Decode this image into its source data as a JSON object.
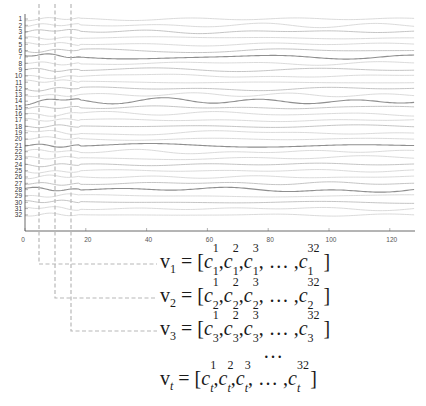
{
  "chart_data": {
    "type": "line",
    "title": "",
    "xlabel": "",
    "ylabel": "",
    "x_ticks": [
      0,
      20,
      40,
      60,
      80,
      100,
      120
    ],
    "xlim": [
      0,
      128
    ],
    "channels": [
      "1",
      "2",
      "3",
      "4",
      "5",
      "6",
      "7",
      "8",
      "9",
      "10",
      "11",
      "12",
      "13",
      "14",
      "15",
      "16",
      "17",
      "18",
      "19",
      "20",
      "21",
      "22",
      "23",
      "24",
      "25",
      "26",
      "27",
      "28",
      "29",
      "30",
      "31",
      "32"
    ],
    "emphasized_channels": [
      7,
      14,
      21,
      28
    ],
    "highlighted_time_steps": [
      5,
      10,
      15
    ],
    "series_description": "32 stacked multichannel EEG-like signal traces over 128 time samples"
  },
  "colors": {
    "trace_light": "#d6d6d6",
    "trace_mid": "#bdbdbd",
    "trace_dark": "#8f8f8f",
    "dashed": "#b8b8b8",
    "axis": "#444444",
    "text": "#1a1a1a"
  },
  "equations": [
    {
      "vector": "v",
      "sub": "1",
      "italic_sub": false,
      "elements": [
        {
          "sup": "1",
          "sub": "1"
        },
        {
          "sup": "2",
          "sub": "1"
        },
        {
          "sup": "3",
          "sub": "1"
        }
      ],
      "ellipsis": "…",
      "last": {
        "sup": "32",
        "sub": "1"
      }
    },
    {
      "vector": "v",
      "sub": "2",
      "italic_sub": false,
      "elements": [
        {
          "sup": "1",
          "sub": "2"
        },
        {
          "sup": "2",
          "sub": "2"
        },
        {
          "sup": "3",
          "sub": "2"
        }
      ],
      "ellipsis": "…",
      "last": {
        "sup": "32",
        "sub": "2"
      }
    },
    {
      "vector": "v",
      "sub": "3",
      "italic_sub": false,
      "elements": [
        {
          "sup": "1",
          "sub": "3"
        },
        {
          "sup": "2",
          "sub": "3"
        },
        {
          "sup": "3",
          "sub": "3"
        }
      ],
      "ellipsis": "…",
      "last": {
        "sup": "32",
        "sub": "3"
      }
    },
    {
      "vector": "v",
      "sub": "t",
      "italic_sub": true,
      "elements": [
        {
          "sup": "1",
          "sub": "t"
        },
        {
          "sup": "2",
          "sub": "t"
        },
        {
          "sup": "3",
          "sub": "t"
        }
      ],
      "ellipsis": "…",
      "last": {
        "sup": "32",
        "sub": "t"
      }
    }
  ],
  "vertical_ellipsis": "…",
  "labels": {
    "equals": "=",
    "open_bracket": "[",
    "close_bracket": "]",
    "comma": ",",
    "c": "c"
  }
}
